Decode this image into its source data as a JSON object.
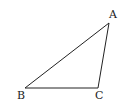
{
  "diagram": {
    "type": "triangle",
    "stroke_color": "#222222",
    "vertices": [
      {
        "label": "A",
        "x": 109,
        "y": 23,
        "label_x": 109,
        "label_y": 18
      },
      {
        "label": "B",
        "x": 25,
        "y": 88,
        "label_x": 17,
        "label_y": 99
      },
      {
        "label": "C",
        "x": 98,
        "y": 88,
        "label_x": 95,
        "label_y": 99
      }
    ]
  }
}
